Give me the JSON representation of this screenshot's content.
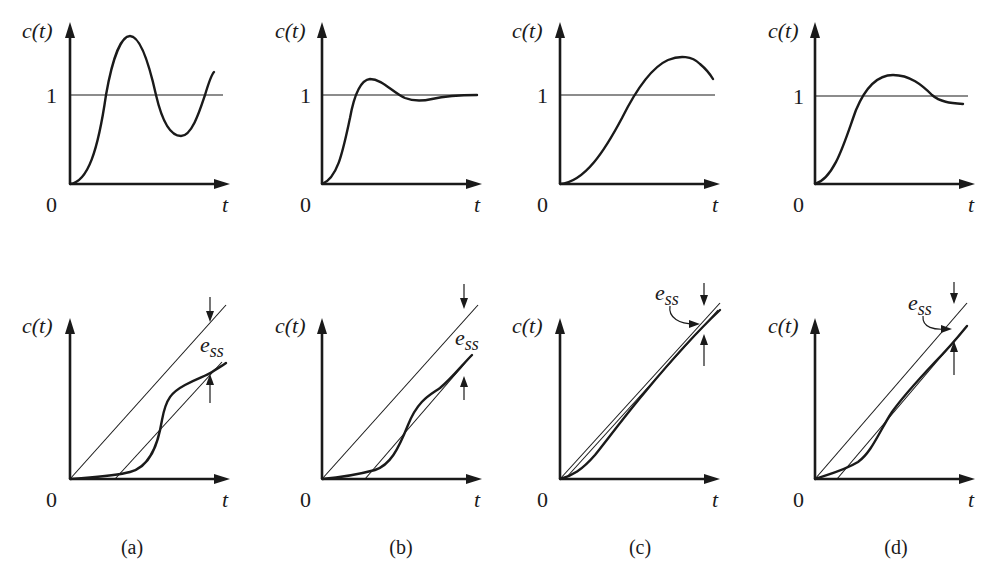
{
  "figure": {
    "panels": [
      {
        "id": "a",
        "caption": "(a)"
      },
      {
        "id": "b",
        "caption": "(b)"
      },
      {
        "id": "c",
        "caption": "(c)"
      },
      {
        "id": "d",
        "caption": "(d)"
      }
    ],
    "labels": {
      "y_axis": "c(t)",
      "x_axis": "t",
      "origin": "0",
      "unit_level": "1",
      "error": "e",
      "error_subscript": "ss"
    },
    "rows": [
      {
        "name": "step-response",
        "description": "Step responses with reference level 1"
      },
      {
        "name": "ramp-response",
        "description": "Ramp responses with steady-state error e_ss"
      }
    ]
  }
}
